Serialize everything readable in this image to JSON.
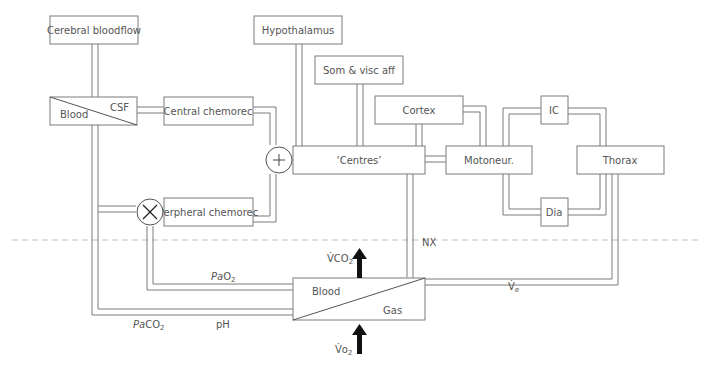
{
  "diagram": {
    "boxes": {
      "cerebral_bloodflow": "Cerebral bloodflow",
      "hypothalamus": "Hypothalamus",
      "som_visc_aff": "Som & visc aff",
      "cortex": "Cortex",
      "blood_csf_blood": "Blood",
      "blood_csf_csf": "CSF",
      "central_chemorec": "Central chemorec",
      "centres": "‘Centres’",
      "motoneur": "Motoneur.",
      "ic": "IC",
      "thorax": "Thorax",
      "dia": "Dia",
      "peripheral_chemorec": "Perpheral chemorec",
      "lung_blood": "Blood",
      "lung_gas": "Gas"
    },
    "junctions": {
      "sum": "+",
      "multiply": "×"
    },
    "labels": {
      "nx": "NX",
      "pao2_main": "Pa",
      "pao2_sub": "O",
      "pao2_subscript": "2",
      "paco2_main": "Pa",
      "paco2_sub": "CO",
      "paco2_subscript": "2",
      "ph": "pH",
      "vco2_main": "V̇CO",
      "vco2_subscript": "2",
      "vo2_main": "V̇o",
      "vo2_subscript": "2",
      "ve_main": "V̇",
      "ve_subscript": "e"
    }
  }
}
